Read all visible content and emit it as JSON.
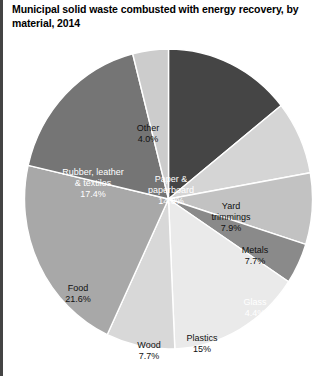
{
  "figure": {
    "title": "Municipal solid waste combusted with energy recovery, by material, 2014",
    "border_color": "#444444",
    "background": "#ffffff"
  },
  "chart_data": {
    "type": "pie",
    "title": "Municipal solid waste combusted with energy recovery, by material, 2014",
    "xlabel": "",
    "ylabel": "",
    "legend": "none",
    "grid": false,
    "start_angle_deg": 0,
    "direction": "clockwise",
    "units": "percent",
    "categories": [
      "Paper & paperboard",
      "Yard trimmings",
      "Metals",
      "Glass",
      "Plastics",
      "Wood",
      "Food",
      "Rubber, leather & textiles",
      "Other"
    ],
    "values": [
      14.3,
      7.9,
      7.7,
      4.4,
      15.0,
      7.7,
      21.6,
      17.4,
      4.0
    ],
    "slices": [
      {
        "name": "Paper & paperboard",
        "label_line1": "Paper &",
        "label_line2": "paperboard",
        "value": 14.3,
        "value_text": "14.3%",
        "color": "#454545",
        "text_color": "light"
      },
      {
        "name": "Yard trimmings",
        "label_line1": "Yard",
        "label_line2": "trimmings",
        "value": 7.9,
        "value_text": "7.9%",
        "color": "#d5d5d5",
        "text_color": "dark"
      },
      {
        "name": "Metals",
        "label_line1": "Metals",
        "label_line2": "",
        "value": 7.7,
        "value_text": "7.7%",
        "color": "#c2c2c2",
        "text_color": "dark"
      },
      {
        "name": "Glass",
        "label_line1": "Glass",
        "label_line2": "",
        "value": 4.4,
        "value_text": "4.4%",
        "color": "#8a8a8a",
        "text_color": "light"
      },
      {
        "name": "Plastics",
        "label_line1": "Plastics",
        "label_line2": "",
        "value": 15.0,
        "value_text": "15%",
        "color": "#eaeaea",
        "text_color": "dark"
      },
      {
        "name": "Wood",
        "label_line1": "Wood",
        "label_line2": "",
        "value": 7.7,
        "value_text": "7.7%",
        "color": "#d8d8d8",
        "text_color": "dark"
      },
      {
        "name": "Food",
        "label_line1": "Food",
        "label_line2": "",
        "value": 21.6,
        "value_text": "21.6%",
        "color": "#a8a8a8",
        "text_color": "dark"
      },
      {
        "name": "Rubber, leather & textiles",
        "label_line1": "Rubber, leather",
        "label_line2": "& textiles",
        "value": 17.4,
        "value_text": "17.4%",
        "color": "#757575",
        "text_color": "light"
      },
      {
        "name": "Other",
        "label_line1": "Other",
        "label_line2": "",
        "value": 4.0,
        "value_text": "4.0%",
        "color": "#cccccc",
        "text_color": "dark"
      }
    ]
  },
  "label_positions": [
    {
      "left": 147,
      "top": 126,
      "anchor": "center"
    },
    {
      "left": 207,
      "top": 153,
      "anchor": "center"
    },
    {
      "left": 231,
      "top": 197,
      "anchor": "center"
    },
    {
      "left": 231,
      "top": 249,
      "anchor": "center"
    },
    {
      "left": 178,
      "top": 285,
      "anchor": "center"
    },
    {
      "left": 125,
      "top": 292,
      "anchor": "center"
    },
    {
      "left": 54,
      "top": 235,
      "anchor": "center"
    },
    {
      "left": 69,
      "top": 119,
      "anchor": "center"
    },
    {
      "left": 124,
      "top": 75,
      "anchor": "center"
    }
  ]
}
